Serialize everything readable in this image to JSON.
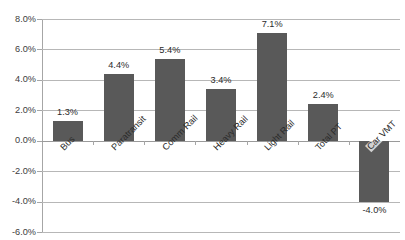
{
  "chart_data": {
    "type": "bar",
    "title": "",
    "xlabel": "",
    "ylabel": "",
    "categories": [
      "Bus",
      "Paratransit",
      "Comm Rail",
      "Heavy Rail",
      "Light Rail",
      "Total PT",
      "Car VMT"
    ],
    "values": [
      1.3,
      4.4,
      5.4,
      3.4,
      7.1,
      2.4,
      -4.0
    ],
    "value_labels": [
      "1.3%",
      "4.4%",
      "5.4%",
      "3.4%",
      "7.1%",
      "2.4%",
      "-4.0%"
    ],
    "ylim": [
      -6.0,
      8.0
    ],
    "ytick_values": [
      8.0,
      6.0,
      4.0,
      2.0,
      0.0,
      -2.0,
      -4.0,
      -6.0
    ],
    "ytick_labels": [
      "8.0%",
      "6.0%",
      "4.0%",
      "2.0%",
      "0.0%",
      "-2.0%",
      "-4.0%",
      "-6.0%"
    ],
    "grid": true,
    "legend": "none",
    "series_color": "#595959",
    "gridline_color": "#b7b7b7",
    "axis_color": "#a6a6a6"
  }
}
